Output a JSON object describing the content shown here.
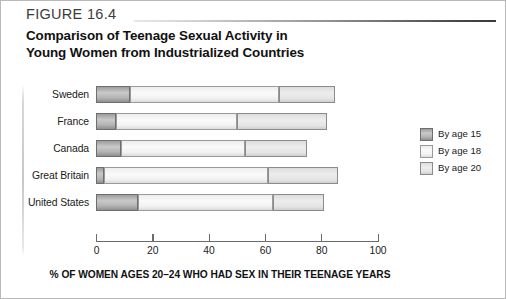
{
  "header": {
    "figure_number": "FIGURE 16.4",
    "title_line_1": "Comparison of Teenage Sexual Activity in",
    "title_line_2": "Young Women from Industrialized Countries"
  },
  "chart_data": {
    "type": "bar",
    "orientation": "horizontal",
    "stacked": true,
    "title": "Comparison of Teenage Sexual Activity in Young Women from Industrialized Countries",
    "xlabel": "% OF WOMEN AGES 20–24 WHO HAD SEX IN THEIR TEENAGE YEARS",
    "ylabel": "",
    "xlim": [
      0,
      100
    ],
    "xticks": [
      0,
      20,
      40,
      60,
      80,
      100
    ],
    "xtick_labels": [
      "0",
      "20",
      "40",
      "60",
      "80",
      "100"
    ],
    "grid": false,
    "legend_position": "right",
    "categories": [
      "Sweden",
      "France",
      "Canada",
      "Great Britain",
      "United States"
    ],
    "series": [
      {
        "name": "By age 15",
        "color": "#b4b4b4",
        "values": [
          12,
          7,
          9,
          3,
          15
        ]
      },
      {
        "name": "By age 18",
        "color": "#f2f2f2",
        "values": [
          53,
          43,
          44,
          58,
          48
        ]
      },
      {
        "name": "By age 20",
        "color": "#e4e4e4",
        "values": [
          20,
          32,
          22,
          25,
          18
        ]
      }
    ],
    "cumulative_by_age_15": [
      12,
      7,
      9,
      3,
      15
    ],
    "cumulative_by_age_18": [
      65,
      50,
      53,
      61,
      63
    ],
    "cumulative_by_age_20": [
      85,
      82,
      75,
      86,
      81
    ]
  },
  "legend": {
    "items": [
      {
        "label": "By age 15",
        "swatch": "dark-gray"
      },
      {
        "label": "By age 18",
        "swatch": "very-light-gray"
      },
      {
        "label": "By age 20",
        "swatch": "light-gray"
      }
    ]
  },
  "colors": {
    "series_15": "#b4b4b4",
    "series_18": "#f2f2f2",
    "series_20": "#e4e4e4",
    "axis": "#6b6b6b",
    "text": "#111111",
    "rule": "#3a3a3a"
  }
}
